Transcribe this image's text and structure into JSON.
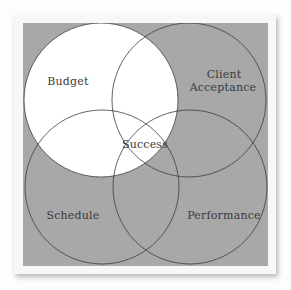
{
  "diagram": {
    "type": "venn",
    "colors": {
      "background_gray": "#a8a8a8",
      "highlight_fill": "#ffffff",
      "outline": "#3c3c3c",
      "card": "#f7f7f7",
      "text": "#3a3a3a"
    },
    "circles": [
      {
        "id": "budget",
        "label": "Budget",
        "highlighted": true
      },
      {
        "id": "client-acceptance",
        "label_line1": "Client",
        "label_line2": "Acceptance",
        "highlighted": false
      },
      {
        "id": "schedule",
        "label": "Schedule",
        "highlighted": false
      },
      {
        "id": "performance",
        "label": "Performance",
        "highlighted": false
      }
    ],
    "center_label": "Success"
  }
}
